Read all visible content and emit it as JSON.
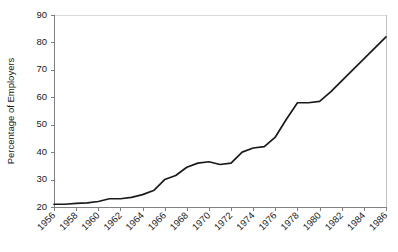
{
  "chart_data": {
    "type": "line",
    "title": "",
    "subtitle": "",
    "xlabel": "",
    "ylabel": "Percentage of Employers",
    "xlim": [
      1956,
      1986
    ],
    "ylim": [
      20,
      90
    ],
    "ytick_step": 10,
    "xtick_step": 2,
    "grid": false,
    "legend": null,
    "legend_position": "none",
    "ytick_labels": [
      "20",
      "30",
      "40",
      "50",
      "60",
      "70",
      "80",
      "90"
    ],
    "ytick_values": [
      20,
      30,
      40,
      50,
      60,
      70,
      80,
      90
    ],
    "xtick_labels": [
      "1956",
      "1958",
      "1960",
      "1962",
      "1964",
      "1966",
      "1968",
      "1970",
      "1972",
      "1974",
      "1976",
      "1978",
      "1980",
      "1982",
      "1984",
      "1986"
    ],
    "xtick_values": [
      1956,
      1958,
      1960,
      1962,
      1964,
      1966,
      1968,
      1970,
      1972,
      1974,
      1976,
      1978,
      1980,
      1982,
      1984,
      1986
    ],
    "series": [
      {
        "name": "Percentage of Employers",
        "color": "#1a1a1a",
        "x": [
          1956,
          1957,
          1958,
          1959,
          1960,
          1961,
          1962,
          1963,
          1964,
          1965,
          1966,
          1967,
          1968,
          1969,
          1970,
          1971,
          1972,
          1973,
          1974,
          1975,
          1976,
          1977,
          1978,
          1979,
          1980,
          1981,
          1982,
          1983,
          1984,
          1985,
          1986
        ],
        "values": [
          21,
          21,
          21.3,
          21.5,
          22,
          23,
          23,
          23.5,
          24.5,
          26,
          30,
          31.5,
          34.5,
          36,
          36.5,
          35.5,
          36,
          40,
          41.5,
          42,
          45.5,
          52,
          58,
          58,
          58.5,
          62,
          66,
          70,
          74,
          78,
          82
        ]
      }
    ],
    "axis_colors": {
      "axis": "#808080",
      "tick": "#808080",
      "plot_top_border": "#d9d9d9",
      "plot_right_border": "#bfbfbf",
      "text": "#1a1a1a"
    }
  },
  "plot_geometry": {
    "left": 54,
    "right": 386,
    "top": 15,
    "bottom": 207
  }
}
